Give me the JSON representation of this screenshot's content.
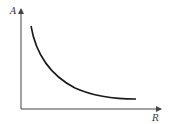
{
  "diagram": {
    "y_axis_label": "A",
    "x_axis_label": "R",
    "curve": "decreasing convex curve (inverse relationship)",
    "colors": {
      "axis": "#444444",
      "curve": "#1a1a1a",
      "background": "#ffffff"
    }
  }
}
